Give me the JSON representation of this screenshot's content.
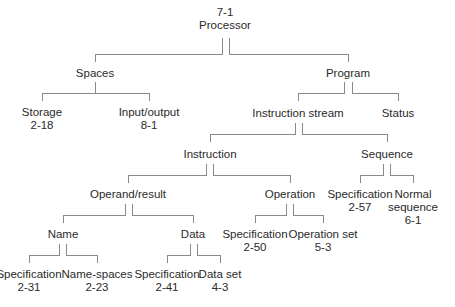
{
  "diagram": {
    "type": "tree",
    "root": "processor",
    "nodes": {
      "processor": {
        "label": "Processor",
        "ref": "7-1",
        "x": 225,
        "y": 6
      },
      "spaces": {
        "label": "Spaces",
        "ref": null,
        "x": 95,
        "y": 67
      },
      "program": {
        "label": "Program",
        "ref": null,
        "x": 348,
        "y": 67
      },
      "storage": {
        "label": "Storage",
        "ref": "2-18",
        "x": 42,
        "y": 108
      },
      "input_output": {
        "label": "Input/output",
        "ref": "8-1",
        "x": 149,
        "y": 108
      },
      "instruction_stream": {
        "label": "Instruction stream",
        "ref": null,
        "x": 298,
        "y": 108
      },
      "status": {
        "label": "Status",
        "ref": null,
        "x": 398,
        "y": 108
      },
      "instruction": {
        "label": "Instruction",
        "ref": null,
        "x": 210,
        "y": 149
      },
      "sequence": {
        "label": "Sequence",
        "ref": null,
        "x": 387,
        "y": 149
      },
      "operand_result": {
        "label": "Operand/result",
        "ref": null,
        "x": 128,
        "y": 189
      },
      "operation": {
        "label": "Operation",
        "ref": null,
        "x": 290,
        "y": 189
      },
      "seq_specification": {
        "label": "Specification",
        "ref": "2-57",
        "x": 360,
        "y": 189
      },
      "normal_sequence": {
        "label": "Normal",
        "label2": "sequence",
        "ref": "6-1",
        "x": 413,
        "y": 189
      },
      "name": {
        "label": "Name",
        "ref": null,
        "x": 63,
        "y": 229
      },
      "data": {
        "label": "Data",
        "ref": null,
        "x": 193,
        "y": 229
      },
      "op_specification": {
        "label": "Specification",
        "ref": "2-50",
        "x": 255,
        "y": 229
      },
      "operation_set": {
        "label": "Operation set",
        "ref": "5-3",
        "x": 323,
        "y": 229
      },
      "name_specification": {
        "label": "Specification",
        "ref": "2-31",
        "x": 29,
        "y": 269
      },
      "name_spaces": {
        "label": "Name-spaces",
        "ref": "2-23",
        "x": 97,
        "y": 269
      },
      "data_specification": {
        "label": "Specification",
        "ref": "2-41",
        "x": 167,
        "y": 269
      },
      "data_set": {
        "label": "Data set",
        "ref": "4-3",
        "x": 220,
        "y": 269
      }
    },
    "edges": [
      [
        "processor",
        "spaces"
      ],
      [
        "processor",
        "program"
      ],
      [
        "spaces",
        "storage"
      ],
      [
        "spaces",
        "input_output"
      ],
      [
        "program",
        "instruction_stream"
      ],
      [
        "program",
        "status"
      ],
      [
        "instruction_stream",
        "instruction"
      ],
      [
        "instruction_stream",
        "sequence"
      ],
      [
        "instruction",
        "operand_result"
      ],
      [
        "instruction",
        "operation"
      ],
      [
        "sequence",
        "seq_specification"
      ],
      [
        "sequence",
        "normal_sequence"
      ],
      [
        "operand_result",
        "name"
      ],
      [
        "operand_result",
        "data"
      ],
      [
        "operation",
        "op_specification"
      ],
      [
        "operation",
        "operation_set"
      ],
      [
        "name",
        "name_specification"
      ],
      [
        "name",
        "name_spaces"
      ],
      [
        "data",
        "data_specification"
      ],
      [
        "data",
        "data_set"
      ]
    ],
    "line_color": "#8a8a8a",
    "text_color": "#2a2a2a"
  }
}
